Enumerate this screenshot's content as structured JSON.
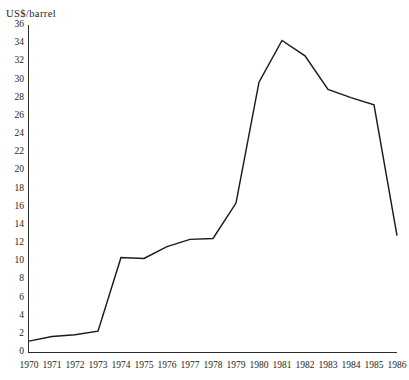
{
  "chart_data": {
    "type": "line",
    "title": "",
    "subtitle": "",
    "xlabel": "",
    "ylabel": "US$/barrel",
    "categories": [
      "1970",
      "1971",
      "1972",
      "1973",
      "1974",
      "1975",
      "1976",
      "1977",
      "1978",
      "1979",
      "1980",
      "1981",
      "1982",
      "1983",
      "1984",
      "1985",
      "1986"
    ],
    "x": [
      1970,
      1971,
      1972,
      1973,
      1974,
      1975,
      1976,
      1977,
      1978,
      1979,
      1980,
      1981,
      1982,
      1983,
      1984,
      1985,
      1986
    ],
    "values": [
      1.2,
      1.7,
      1.9,
      2.3,
      10.4,
      10.3,
      11.6,
      12.4,
      12.5,
      16.4,
      29.7,
      34.3,
      32.6,
      28.9,
      28.0,
      27.2,
      12.8
    ],
    "series": [
      {
        "name": "US$/barrel",
        "values": [
          1.2,
          1.7,
          1.9,
          2.3,
          10.4,
          10.3,
          11.6,
          12.4,
          12.5,
          16.4,
          29.7,
          34.3,
          32.6,
          28.9,
          28.0,
          27.2,
          12.8
        ]
      }
    ],
    "ylim": [
      0,
      36
    ],
    "xlim": [
      1970,
      1986
    ],
    "yticks": [
      0,
      2,
      4,
      6,
      8,
      10,
      12,
      14,
      16,
      18,
      20,
      22,
      24,
      26,
      28,
      30,
      32,
      34,
      36
    ],
    "ytick_labels": [
      "0",
      "2",
      "4",
      "6",
      "8",
      "10",
      "12",
      "14",
      "16",
      "18",
      "20",
      "22",
      "24",
      "26",
      "28",
      "30",
      "32",
      "34",
      "36"
    ],
    "xtick_labels": [
      "1970",
      "1971",
      "1972",
      "1973",
      "1974",
      "1975",
      "1976",
      "1977",
      "1978",
      "1979",
      "1980",
      "1981",
      "1982",
      "1983",
      "1984",
      "1985",
      "1986"
    ],
    "grid": false,
    "legend": false,
    "legend_position": "none",
    "line_color": "#1a1a1a",
    "background_color": "#ffffff",
    "axis_color": "#2b2b2b"
  },
  "axis": {
    "y_axis_title": "US$/barrel"
  }
}
